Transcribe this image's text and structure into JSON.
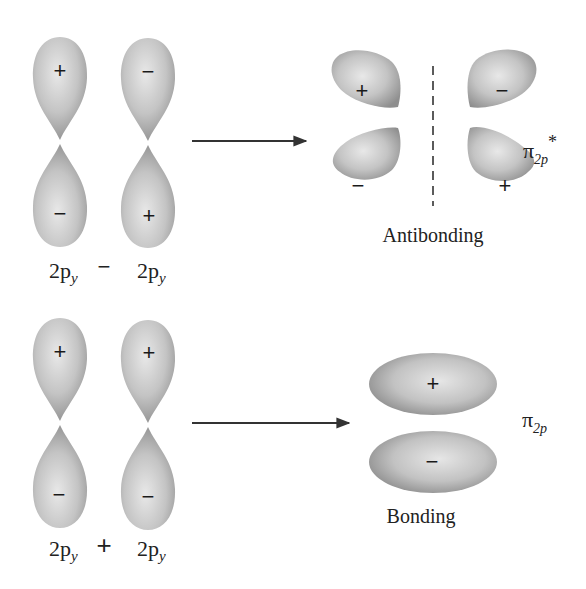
{
  "antibonding": {
    "inputs": [
      {
        "orbital_label": "2p",
        "subscript": "y",
        "top_sign": "+",
        "bottom_sign": "−"
      },
      {
        "orbital_label": "2p",
        "subscript": "y",
        "top_sign": "−",
        "bottom_sign": "+"
      }
    ],
    "operator": "−",
    "result": {
      "lobes": {
        "top_left": "+",
        "top_right": "−",
        "bottom_left": "−",
        "bottom_right": "+"
      },
      "caption": "Antibonding",
      "symbol": "π",
      "symbol_subscript": "2p",
      "symbol_superscript": "*"
    }
  },
  "bonding": {
    "inputs": [
      {
        "orbital_label": "2p",
        "subscript": "y",
        "top_sign": "+",
        "bottom_sign": "−"
      },
      {
        "orbital_label": "2p",
        "subscript": "y",
        "top_sign": "+",
        "bottom_sign": "−"
      }
    ],
    "operator": "+",
    "result": {
      "lobes": {
        "top": "+",
        "bottom": "−"
      },
      "caption": "Bonding",
      "symbol": "π",
      "symbol_subscript": "2p"
    }
  },
  "colors": {
    "lobe_light": "#e4e4e4",
    "lobe_mid": "#bdbdbd",
    "lobe_dark": "#8f8f8f",
    "arrow": "#333333",
    "text": "#222222"
  }
}
